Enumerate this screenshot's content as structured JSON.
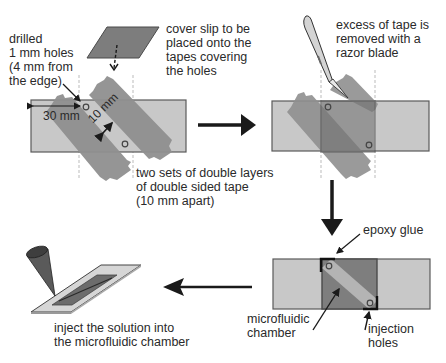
{
  "diagram": {
    "type": "process-flow",
    "colors": {
      "slide_fill": "#c8c8c8",
      "slide_stroke": "#5a5a5a",
      "tape_fill": "#8f8f8f",
      "cover_slip_fill": "#7d7d7d",
      "chamber_fill": "#b4b4b4",
      "arrow": "#1a1a1a",
      "text": "#2a2a2a"
    },
    "steps": [
      {
        "id": 1,
        "name": "tape-and-drill",
        "labels": {
          "holes": "drilled\n1 mm holes\n(4 mm from\nthe edge)",
          "cover_slip": "cover slip to be\nplaced onto the\ntapes covering\nthe holes",
          "tape": "two sets of double layers\nof double sided tape\n(10 mm apart)",
          "dim_30": "30 mm",
          "dim_10": "10 mm"
        }
      },
      {
        "id": 2,
        "name": "trim-tape",
        "labels": {
          "razor": "excess of tape is\nremoved with a\nrazor blade"
        }
      },
      {
        "id": 3,
        "name": "seal-chamber",
        "labels": {
          "epoxy": "epoxy glue",
          "chamber": "microfluidic\nchamber",
          "holes": "injection\nholes"
        }
      },
      {
        "id": 4,
        "name": "inject",
        "labels": {
          "inject": "inject the solution into\nthe microfluidic chamber"
        }
      }
    ],
    "arrows": [
      {
        "from": 1,
        "to": 2,
        "direction": "right"
      },
      {
        "from": 2,
        "to": 3,
        "direction": "down"
      },
      {
        "from": 3,
        "to": 4,
        "direction": "left"
      }
    ]
  }
}
